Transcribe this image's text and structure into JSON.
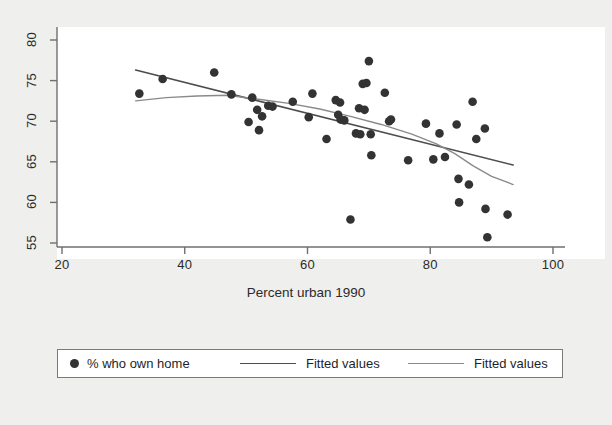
{
  "figure": {
    "background_color": "#efefed",
    "plot_background_color": "#ffffff",
    "axis_color": "#6f6f6f"
  },
  "axis": {
    "x_title": "Percent urban 1990",
    "x_ticks": [
      "20",
      "40",
      "60",
      "80",
      "100"
    ],
    "y_ticks": [
      "55",
      "60",
      "65",
      "70",
      "75",
      "80"
    ]
  },
  "legend": {
    "entries": [
      {
        "label": "% who own home",
        "marker": "filled-circle",
        "color": "#333333"
      },
      {
        "label": "Fitted values",
        "marker": "line",
        "color": "#4d4d4d"
      },
      {
        "label": "Fitted values",
        "marker": "line",
        "color": "#8a8a8a"
      }
    ]
  },
  "chart_data": {
    "type": "scatter",
    "title": "",
    "xlabel": "Percent urban 1990",
    "ylabel": "",
    "xlim": [
      20,
      100
    ],
    "ylim": [
      55,
      80
    ],
    "xticks": [
      20,
      40,
      60,
      80,
      100
    ],
    "yticks": [
      55,
      60,
      65,
      70,
      75,
      80
    ],
    "grid": false,
    "legend_position": "below-plot",
    "series": [
      {
        "name": "% who own home",
        "type": "scatter",
        "marker": "filled-circle",
        "color": "#333333",
        "points": [
          [
            32.6,
            73.4
          ],
          [
            36.4,
            75.2
          ],
          [
            44.8,
            76.0
          ],
          [
            47.6,
            73.3
          ],
          [
            50.4,
            69.9
          ],
          [
            51.0,
            72.9
          ],
          [
            51.8,
            71.4
          ],
          [
            52.1,
            68.9
          ],
          [
            52.6,
            70.6
          ],
          [
            53.6,
            71.9
          ],
          [
            54.3,
            71.8
          ],
          [
            57.6,
            72.4
          ],
          [
            60.2,
            70.5
          ],
          [
            60.8,
            73.4
          ],
          [
            63.1,
            67.8
          ],
          [
            64.6,
            72.6
          ],
          [
            65.0,
            70.8
          ],
          [
            65.3,
            72.3
          ],
          [
            65.4,
            70.2
          ],
          [
            66.0,
            70.1
          ],
          [
            67.0,
            57.9
          ],
          [
            67.9,
            68.5
          ],
          [
            68.4,
            71.6
          ],
          [
            68.6,
            68.4
          ],
          [
            69.0,
            74.6
          ],
          [
            69.3,
            71.4
          ],
          [
            69.6,
            74.7
          ],
          [
            70.0,
            77.4
          ],
          [
            70.3,
            68.4
          ],
          [
            70.4,
            65.8
          ],
          [
            72.6,
            73.5
          ],
          [
            73.3,
            70.0
          ],
          [
            73.6,
            70.2
          ],
          [
            76.4,
            65.2
          ],
          [
            79.3,
            69.7
          ],
          [
            80.5,
            65.3
          ],
          [
            81.5,
            68.5
          ],
          [
            82.4,
            65.6
          ],
          [
            84.3,
            69.6
          ],
          [
            84.6,
            62.9
          ],
          [
            84.7,
            60.0
          ],
          [
            86.3,
            62.2
          ],
          [
            86.9,
            72.4
          ],
          [
            87.5,
            67.8
          ],
          [
            88.9,
            69.1
          ],
          [
            89.0,
            59.2
          ],
          [
            89.3,
            55.7
          ],
          [
            92.6,
            58.5
          ]
        ]
      },
      {
        "name": "Fitted values",
        "type": "line",
        "style": "linear-fit",
        "color": "#4d4d4d",
        "points": [
          [
            32.0,
            76.3
          ],
          [
            93.5,
            64.6
          ]
        ]
      },
      {
        "name": "Fitted values",
        "type": "line",
        "style": "lowess-fit",
        "color": "#8a8a8a",
        "points": [
          [
            32.0,
            72.5
          ],
          [
            37.0,
            72.9
          ],
          [
            42.0,
            73.1
          ],
          [
            47.0,
            73.2
          ],
          [
            52.0,
            72.7
          ],
          [
            57.0,
            72.2
          ],
          [
            62.0,
            71.5
          ],
          [
            67.0,
            70.6
          ],
          [
            72.0,
            69.6
          ],
          [
            77.0,
            68.4
          ],
          [
            81.0,
            67.2
          ],
          [
            84.0,
            66.0
          ],
          [
            87.0,
            64.5
          ],
          [
            90.0,
            63.2
          ],
          [
            93.5,
            62.2
          ]
        ]
      }
    ]
  }
}
